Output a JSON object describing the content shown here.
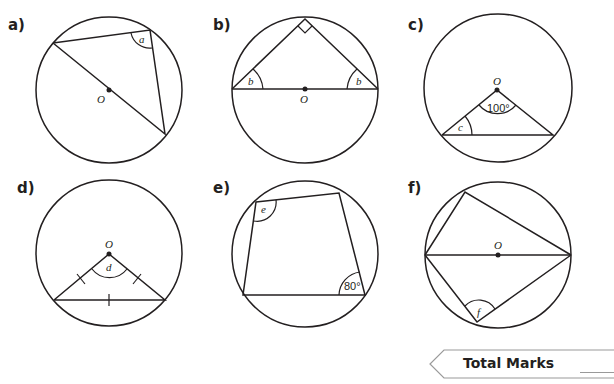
{
  "questions": [
    {
      "label": "a)",
      "centre_label": "O",
      "angle_labels": [
        "a"
      ]
    },
    {
      "label": "b)",
      "centre_label": "O",
      "angle_labels": [
        "b",
        "b"
      ]
    },
    {
      "label": "c)",
      "centre_label": "O",
      "angle_labels": [
        "c"
      ],
      "given_angle": "100°"
    },
    {
      "label": "d)",
      "centre_label": "O",
      "angle_labels": [
        "d"
      ]
    },
    {
      "label": "e)",
      "angle_labels": [
        "e"
      ],
      "given_angle": "80°"
    },
    {
      "label": "f)",
      "centre_label": "O",
      "angle_labels": [
        "f"
      ]
    }
  ],
  "footer": {
    "total_marks_label": "Total Marks"
  },
  "colors": {
    "ink": "#231f20",
    "background": "#ffffff"
  }
}
